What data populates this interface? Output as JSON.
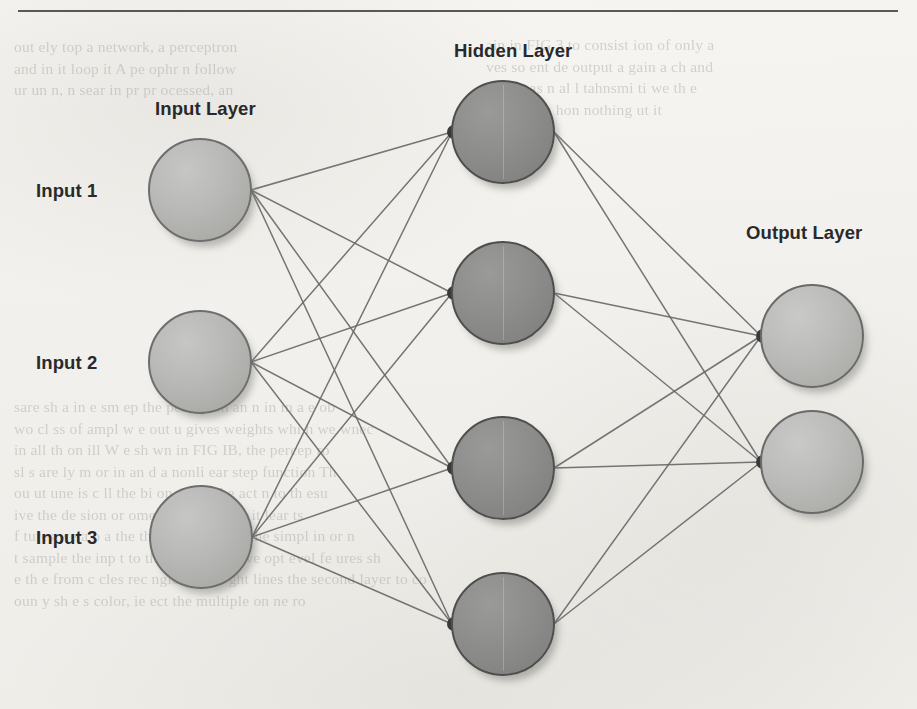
{
  "page": {
    "width": 917,
    "height": 709,
    "background_color": "#f3f2ef",
    "rule_color": "#4b4b4b"
  },
  "labels": {
    "input_layer": "Input Layer",
    "hidden_layer": "Hidden Layer",
    "output_layer": "Output Layer",
    "input_1": "Input 1",
    "input_2": "Input 2",
    "input_3": "Input 3"
  },
  "colors": {
    "input_node_fill": "#b3b3b1",
    "hidden_node_fill": "#8b8b89",
    "output_node_fill": "#bababa",
    "node_stroke": "#5a5a5a",
    "edge": "#6b6b6b",
    "label_text": "#29292b"
  },
  "ghost_text": {
    "left": [
      "out ely  top a network, a perceptron",
      "and  in it  loop it  A  pe ophr n follow",
      "ur  un  n,  n  sear  in  pr  pr  ocessed, an"
    ],
    "right": [
      "ain  in   FIG  3  to consist   ion  of only   a",
      "ves  so  ent  de  output  a gain   a  ch  and",
      "le  by  pas  n  al  l  tahnsmi  ti  we   th  e",
      "",
      "orwa   ot   as  hon  nothing   ut  it"
    ],
    "mid": [
      "sare  sh  a  in   e  sm  ep  the  percep  on   an  n in  in  a  e  ob",
      "wo  cl ss  of  ampl   w  e  out  u   gives  weights  whi  h  we  wnec",
      "in   all  th  on  ill   W   e  sh  wn  in  FIG  IB,  the  percep  ro",
      "sl  s  are  ly  m  or  in   an  d  a  nonli  ear  step  function   Th",
      "ou  ut  une  is  c  ll  the  bi  on  will  r  the  act  n  to  th  esu",
      "ive   the  de  sion   or  ome  to  things  wh  t  it  lear  ts",
      "f  tures  we  a  o  a  the  the  ons  ain  ng  of  the  simpl  in  or  n",
      "t   sample  the  inp  t  to  th  wo  ng  other  we  opt  evel  fe  ures  sh",
      "e  th  e  from  c  cles  rec  ngles  an  str  ght  lines  the  second  layer  to  co",
      "oun  y  sh  e  s  color,  ie  ect  the  multiple  on  ne  ro"
    ]
  },
  "diagram": {
    "type": "neural-network",
    "layers": [
      {
        "name": "input",
        "label": "Input Layer",
        "label_pos": {
          "x": 155,
          "y": 98
        },
        "node_radius": 52,
        "nodes": [
          {
            "id": "i1",
            "label": "Input 1",
            "cx": 200,
            "cy": 190
          },
          {
            "id": "i2",
            "label": "Input 2",
            "cx": 200,
            "cy": 362
          },
          {
            "id": "i3",
            "label": "Input 3",
            "cx": 201,
            "cy": 537
          }
        ]
      },
      {
        "name": "hidden",
        "label": "Hidden Layer",
        "label_pos": {
          "x": 454,
          "y": 40
        },
        "node_radius": 52,
        "nodes": [
          {
            "id": "h1",
            "cx": 503,
            "cy": 132
          },
          {
            "id": "h2",
            "cx": 503,
            "cy": 293
          },
          {
            "id": "h3",
            "cx": 503,
            "cy": 468
          },
          {
            "id": "h4",
            "cx": 503,
            "cy": 624
          }
        ]
      },
      {
        "name": "output",
        "label": "Output Layer",
        "label_pos": {
          "x": 746,
          "y": 222
        },
        "node_radius": 52,
        "nodes": [
          {
            "id": "o1",
            "cx": 812,
            "cy": 336
          },
          {
            "id": "o2",
            "cx": 812,
            "cy": 462
          }
        ]
      }
    ],
    "edges": [
      {
        "from": "i1",
        "to": "h1"
      },
      {
        "from": "i1",
        "to": "h2"
      },
      {
        "from": "i1",
        "to": "h3"
      },
      {
        "from": "i1",
        "to": "h4"
      },
      {
        "from": "i2",
        "to": "h1"
      },
      {
        "from": "i2",
        "to": "h2"
      },
      {
        "from": "i2",
        "to": "h3"
      },
      {
        "from": "i2",
        "to": "h4"
      },
      {
        "from": "i3",
        "to": "h1"
      },
      {
        "from": "i3",
        "to": "h2"
      },
      {
        "from": "i3",
        "to": "h3"
      },
      {
        "from": "i3",
        "to": "h4"
      },
      {
        "from": "h1",
        "to": "o1"
      },
      {
        "from": "h1",
        "to": "o2"
      },
      {
        "from": "h2",
        "to": "o1"
      },
      {
        "from": "h2",
        "to": "o2"
      },
      {
        "from": "h3",
        "to": "o1"
      },
      {
        "from": "h3",
        "to": "o2"
      },
      {
        "from": "h4",
        "to": "o1"
      },
      {
        "from": "h4",
        "to": "o2"
      }
    ]
  }
}
